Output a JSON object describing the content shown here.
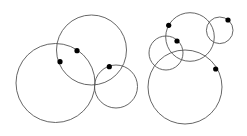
{
  "diagram": {
    "width": 247,
    "height": 136,
    "stroke_color": "#555555",
    "dot_color": "#000000",
    "groups": [
      {
        "name": "left-group",
        "circles": [
          {
            "cx": 55.5,
            "cy": 83,
            "r": 39.5
          },
          {
            "cx": 91.5,
            "cy": 50,
            "r": 35
          },
          {
            "cx": 116,
            "cy": 86.5,
            "r": 21.5
          }
        ],
        "dots": [
          {
            "cx": 77,
            "cy": 50.7
          },
          {
            "cx": 60,
            "cy": 61.7
          },
          {
            "cx": 109.3,
            "cy": 66.7
          }
        ]
      },
      {
        "name": "right-group",
        "circles": [
          {
            "cx": 190,
            "cy": 37,
            "r": 24.3
          },
          {
            "cx": 219.7,
            "cy": 30.3,
            "r": 13.3
          },
          {
            "cx": 166,
            "cy": 53,
            "r": 17
          },
          {
            "cx": 185,
            "cy": 87,
            "r": 37
          }
        ],
        "dots": [
          {
            "cx": 168.7,
            "cy": 25.3
          },
          {
            "cx": 177,
            "cy": 41
          },
          {
            "cx": 228,
            "cy": 20
          },
          {
            "cx": 215.7,
            "cy": 69
          }
        ]
      }
    ]
  }
}
